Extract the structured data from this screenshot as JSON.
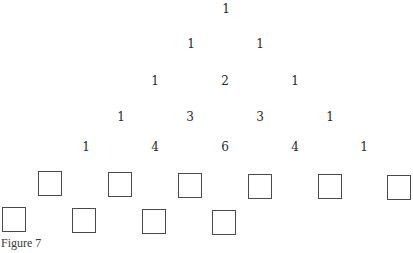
{
  "diagram": {
    "type": "pascal-triangle",
    "rows": [
      {
        "values": [
          "1"
        ],
        "x": [
          226
        ],
        "y": 3
      },
      {
        "values": [
          "1",
          "1"
        ],
        "x": [
          191,
          260
        ],
        "y": 38
      },
      {
        "values": [
          "1",
          "2",
          "1"
        ],
        "x": [
          155,
          225,
          295
        ],
        "y": 75
      },
      {
        "values": [
          "1",
          "3",
          "3",
          "1"
        ],
        "x": [
          121,
          190,
          260,
          330
        ],
        "y": 111
      },
      {
        "values": [
          "1",
          "4",
          "6",
          "4",
          "1"
        ],
        "x": [
          86,
          155,
          225,
          295,
          364
        ],
        "y": 141
      }
    ],
    "empty_boxes": {
      "top_row": [
        {
          "x": 38,
          "y": 171
        },
        {
          "x": 108,
          "y": 172
        },
        {
          "x": 178,
          "y": 173
        },
        {
          "x": 248,
          "y": 174
        },
        {
          "x": 318,
          "y": 174
        },
        {
          "x": 387,
          "y": 175
        }
      ],
      "bottom_row": [
        {
          "x": 2,
          "y": 207
        },
        {
          "x": 72,
          "y": 208
        },
        {
          "x": 142,
          "y": 209
        },
        {
          "x": 212,
          "y": 210
        }
      ]
    }
  },
  "caption": "Figure 7"
}
